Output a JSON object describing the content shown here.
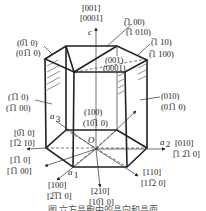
{
  "figure": {
    "type": "hexagonal crystal prism with Miller and Miller-Bravais indices",
    "axes": {
      "c": "c",
      "a1": "a₁",
      "a2": "a₂",
      "a3": "a₃",
      "origin": "O"
    },
    "directions": [
      {
        "id": "c",
        "miller": "[001]",
        "bravais": "[0001]"
      },
      {
        "id": "a2",
        "miller": "[010]",
        "bravais": "[̅1́2̅1̅0]"
      },
      {
        "id": "neg-a2",
        "miller": "[0̅1́0]",
        "bravais": "[́2̅1́0]"
      },
      {
        "id": "d-110",
        "miller": "[110]",
        "bravais": "[11̅2́0]"
      },
      {
        "id": "d-1-10",
        "miller": "[1̅1́0]",
        "bravais": "[1̅1́ 00]"
      },
      {
        "id": "a1",
        "miller": "[100]",
        "bravais": "[2̅1̅1́0]"
      },
      {
        "id": "d-210",
        "miller": "[210]",
        "bravais": "[10̅1́0]"
      }
    ],
    "planes": [
      {
        "id": "top",
        "miller": "(001)",
        "bravais": "(0001)"
      },
      {
        "id": "p-100",
        "miller": "(̅1́ 00)",
        "bravais": "(̅1́ 010)"
      },
      {
        "id": "p-110",
        "miller": "(̅1́ 10)",
        "bravais": "(̅1́ 100)"
      },
      {
        "id": "p-0-10",
        "miller": "(0̅1́0)",
        "bravais": "(01̅1́0)"
      },
      {
        "id": "p-1-10",
        "miller": "(1̅1́0)",
        "bravais": "(1̅1́ 00)"
      },
      {
        "id": "p-010",
        "miller": "(010)",
        "bravais": "(01̅1́0)"
      },
      {
        "id": "p-100-front",
        "miller": "(100)",
        "bravais": "(10̅1́0)"
      }
    ],
    "caption": "图 六方晶胞中的晶向和晶面"
  },
  "labels": {
    "c_dir_1": "[001]",
    "c_dir_2": "[0001]",
    "p100bar_1": "(̅1 00)",
    "p100bar_2": "(̅1 010)",
    "p110bar_1": "(̅1 10)",
    "p110bar_2": "(̅1 100)",
    "p0bar10_1": "(0̅1 0)",
    "p0bar10_2": "(01̅1 0)",
    "top_1": "(001)",
    "top_2": "(0001)",
    "p1bar10_1": "(1̅1 0)",
    "p1bar10_2": "(1̅1 00)",
    "p010_1": "(010)",
    "p010_2": "(01̅1 0)",
    "p100_1": "(100)",
    "p100_2": "(10̅1 0)",
    "d0bar10_1": "[0̅1 0]",
    "d0bar10_2": "[1̅2 10]",
    "d010_1": "[010]",
    "d010_2": "[̅1 2̅1 0]",
    "d1bar10_1": "[1̅1 0]",
    "d1bar10_2": "[1̅1 00]",
    "d110_1": "[110]",
    "d110_2": "[11̅2 0]",
    "d100_1": "[100]",
    "d100_2": "[2̅1̅1 0]",
    "d210_1": "[210]",
    "d210_2": "[10̅1 0]",
    "axis_c": "c",
    "axis_a1": "a",
    "axis_a1_sub": "1",
    "axis_a2": "a",
    "axis_a2_sub": "2",
    "axis_a3": "a",
    "axis_a3_sub": "3",
    "origin": "O",
    "caption": "图 六方晶胞中的晶向和晶面"
  }
}
